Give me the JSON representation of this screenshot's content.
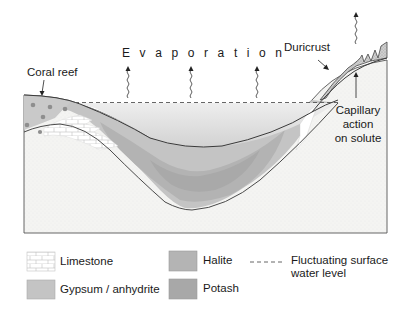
{
  "diagram": {
    "title_label": "Evaporation",
    "labels": {
      "coral_reef": "Coral reef",
      "duricrust": "Duricrust",
      "capillary_line1": "Capillary",
      "capillary_line2": "action",
      "capillary_line3": "on solute"
    },
    "colors": {
      "bedrock": "#f4f4f2",
      "water": "#dcdcdc",
      "gypsum": "#c4c4c4",
      "halite": "#b4b4b4",
      "potash": "#a8a8a8",
      "reef": "#c8c8c8",
      "reef_dots": "#8e8e8e",
      "limestone": "#ffffff",
      "duricrust": "#cfcfcf",
      "outline": "#444444"
    }
  },
  "legend": {
    "items": [
      {
        "label": "Limestone",
        "swatch": "limestone"
      },
      {
        "label": "Gypsum / anhydrite",
        "swatch": "gypsum"
      },
      {
        "label": "Halite",
        "swatch": "halite"
      },
      {
        "label": "Potash",
        "swatch": "potash"
      },
      {
        "label_line1": "Fluctuating surface",
        "label_line2": "water level",
        "swatch": "dashed-line"
      }
    ]
  }
}
